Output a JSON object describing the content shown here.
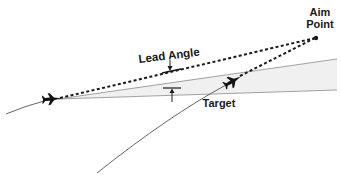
{
  "diagram": {
    "labels": {
      "lead_angle": "Lead Angle",
      "aim_point_line1": "Aim",
      "aim_point_line2": "Point",
      "target": "Target"
    },
    "elements": {
      "attacker": "attacker-aircraft",
      "target": "target-aircraft",
      "aim_point": "aim-point-dot",
      "target_sector": "target-flight-cone"
    },
    "colors": {
      "ink": "#1a1a1a",
      "path_line": "#555555",
      "cone_fill": "#f0f0f0",
      "cone_edge": "#8a8a8a"
    }
  }
}
